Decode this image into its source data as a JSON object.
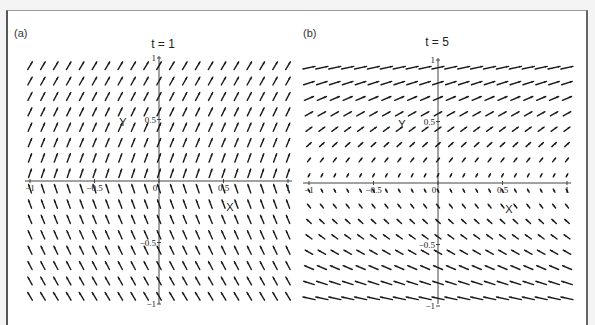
{
  "figure": {
    "panels": [
      {
        "label": "(a)",
        "title": "t = 1"
      },
      {
        "label": "(b)",
        "title": "t = 5"
      }
    ]
  },
  "chart_data": [
    {
      "type": "direction-field",
      "panel": "(a)",
      "title": "t = 1",
      "xlabel": "X",
      "ylabel": "Y",
      "xlim": [
        -1,
        1
      ],
      "ylim": [
        -1,
        1
      ],
      "x_ticks": [
        "-1",
        "-0.5",
        "0",
        "0.5",
        "1"
      ],
      "y_ticks": [
        "1",
        "0.5",
        "-0.5",
        "-1"
      ],
      "grid": false,
      "columns": 20,
      "rows": 16,
      "t": 1,
      "description": "Steep arrows pointing up-right above the x-axis and up-left below; slope magnitude increases toward y=0"
    },
    {
      "type": "direction-field",
      "panel": "(b)",
      "title": "t = 5",
      "xlabel": "X",
      "ylabel": "Y",
      "xlim": [
        -1,
        1
      ],
      "ylim": [
        -1,
        1
      ],
      "x_ticks": [
        "-1",
        "-0.5",
        "0",
        "0.5",
        "1"
      ],
      "y_ticks": [
        "1",
        "0.5",
        "-0.5",
        "-1"
      ],
      "grid": false,
      "columns": 20,
      "rows": 16,
      "t": 5,
      "description": "Nearly horizontal long arrows near y=±1, becoming short and steep near y=0; up-right above axis, up-left below"
    }
  ],
  "colors": {
    "arrow": "#1a1a1a",
    "axis": "#444444",
    "frame": "#555555"
  }
}
